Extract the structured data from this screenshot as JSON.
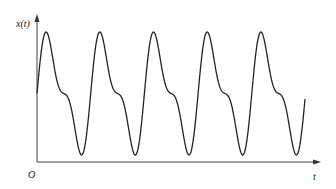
{
  "figure": {
    "y_label": "x(t)",
    "x_label": "t",
    "origin_label": "O"
  },
  "chart_data": {
    "type": "line",
    "title": "",
    "xlabel": "t",
    "ylabel": "x(t)",
    "grid": false,
    "legend": "none",
    "series": [
      {
        "name": "x(t)",
        "formula": "x(t) = sin(wt) + 0.46*sin(2wt) (normalized, offset)",
        "periods_shown": 5,
        "peaks_tall_t": [
          0.13,
          1.12,
          2.12,
          3.13,
          4.12
        ],
        "peaks_short_t": [
          0.59,
          1.6,
          2.59,
          3.59,
          4.59
        ],
        "troughs_shallow_t": [
          0.37,
          1.36,
          2.35,
          3.37,
          4.37
        ],
        "troughs_deep_t": [
          0.86,
          1.86,
          2.85,
          3.85,
          4.86
        ],
        "relative_levels": {
          "tall_peak": 1.0,
          "short_peak": 0.48,
          "shallow_trough": -0.48,
          "deep_trough": -1.0
        },
        "start_value": 0.0,
        "end_t": 5.0
      }
    ],
    "colors": {
      "curve": "#222222",
      "axes": "#444444"
    }
  }
}
